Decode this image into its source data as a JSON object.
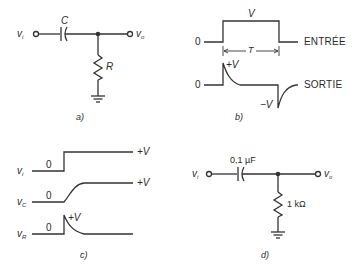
{
  "panels": {
    "a": {
      "caption": "a)",
      "input_label": "v",
      "input_sub": "i",
      "output_label": "v",
      "output_sub": "o",
      "capacitor_label": "C",
      "resistor_label": "R"
    },
    "b": {
      "caption": "b)",
      "input_zero": "0",
      "input_amplitude": "V",
      "input_name": "ENTRÉE",
      "period_label": "T",
      "output_zero": "0",
      "output_pos_peak": "+V",
      "output_neg_peak": "−V",
      "output_name": "SORTIE"
    },
    "c": {
      "caption": "c)",
      "rows": [
        {
          "label": "v",
          "sub": "i",
          "zero": "0",
          "final": "+V"
        },
        {
          "label": "v",
          "sub": "C",
          "zero": "0",
          "final": "+V"
        },
        {
          "label": "v",
          "sub": "R",
          "zero": "0",
          "peak": "+V"
        }
      ]
    },
    "d": {
      "caption": "d)",
      "input_label": "v",
      "input_sub": "i",
      "output_label": "v",
      "output_sub": "o",
      "capacitor_value": "0,1 µF",
      "resistor_value": "1 kΩ"
    }
  },
  "colors": {
    "line": "#333333",
    "background": "#ffffff"
  }
}
